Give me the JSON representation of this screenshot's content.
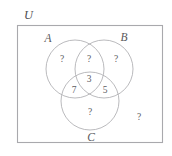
{
  "diagram": {
    "type": "venn-3-set",
    "title_label": "U",
    "universe": {
      "name": "universal-set",
      "label": "U"
    },
    "sets": [
      {
        "key": "A",
        "label": "A",
        "cx": 75,
        "cy": 69,
        "r": 29
      },
      {
        "key": "B",
        "label": "B",
        "cx": 104,
        "cy": 69,
        "r": 29
      },
      {
        "key": "C",
        "label": "C",
        "cx": 90,
        "cy": 101,
        "r": 29
      }
    ],
    "regions": [
      {
        "key": "A_only",
        "label": "A only",
        "value": "?",
        "x": 62,
        "y": 62
      },
      {
        "key": "A_and_B",
        "label": "A and B only",
        "value": "?",
        "x": 89,
        "y": 62
      },
      {
        "key": "B_only",
        "label": "B only",
        "value": "?",
        "x": 116,
        "y": 62
      },
      {
        "key": "A_B_C",
        "label": "A and B and C",
        "value": "3",
        "x": 89,
        "y": 82
      },
      {
        "key": "A_and_C",
        "label": "A and C only",
        "value": "7",
        "x": 74,
        "y": 93
      },
      {
        "key": "B_and_C",
        "label": "B and C only",
        "value": "5",
        "x": 105,
        "y": 93
      },
      {
        "key": "C_only",
        "label": "C only",
        "value": "?",
        "x": 90,
        "y": 115
      },
      {
        "key": "outside",
        "label": "outside all sets",
        "value": "?",
        "x": 139,
        "y": 120
      }
    ],
    "set_label_positions": {
      "A": {
        "x": 48,
        "y": 42
      },
      "B": {
        "x": 124,
        "y": 41
      },
      "C": {
        "x": 91,
        "y": 141
      },
      "U": {
        "x": 24,
        "y": 19
      }
    },
    "colors": {
      "stroke": "#b2b2b6",
      "universe_stroke": "#a9a9ad",
      "text": "#5c5c5f",
      "background": "#ffffff"
    }
  }
}
